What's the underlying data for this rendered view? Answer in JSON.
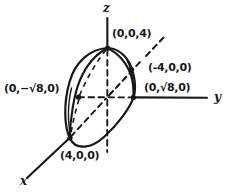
{
  "figure": {
    "style": "hand-drawn ink line art on white",
    "ink_color": "#171717",
    "background_color": "#ffffff",
    "axes": [
      {
        "name": "z",
        "label": "z",
        "direction": "up",
        "style": "solid-upper-dashed-lower"
      },
      {
        "name": "y",
        "label": "y",
        "direction": "right",
        "style": "solid"
      },
      {
        "name": "x",
        "label": "x",
        "direction": "down-left",
        "style": "solid-lower-dashed-upper"
      }
    ],
    "labels": [
      {
        "id": "z-top",
        "text": "(0,0,4)",
        "point": "z-intercept-positive"
      },
      {
        "id": "neg-x",
        "text": "(-4,0,0)",
        "point": "x-intercept-negative"
      },
      {
        "id": "pos-y",
        "text": "(0,√8,0)",
        "radical": true,
        "radicand": "8",
        "point": "y-intercept-positive"
      },
      {
        "id": "neg-y",
        "text": "(0,−√8,0)",
        "radical": true,
        "radicand": "8",
        "point": "y-intercept-negative"
      },
      {
        "id": "pos-x",
        "text": "(4,0,0)",
        "point": "x-intercept-positive"
      }
    ],
    "vertex_dots": [
      {
        "id": "dot-z-top",
        "at": "(0,0,4)"
      },
      {
        "id": "dot-neg-x",
        "at": "(-4,0,0)"
      },
      {
        "id": "dot-pos-y",
        "at": "(0,√8,0)"
      },
      {
        "id": "dot-neg-y",
        "at": "(0,-√8,0)"
      },
      {
        "id": "dot-pos-x",
        "at": "(4,0,0)"
      }
    ],
    "surface": {
      "type": "ellipsoid",
      "outline": "tilted closed ellipse",
      "interior_arcs": [
        "front cross-section arc",
        "rear cross-section arc"
      ]
    }
  }
}
